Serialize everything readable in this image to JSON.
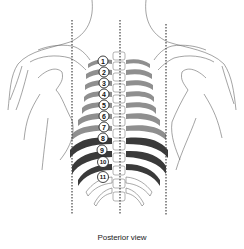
{
  "figure": {
    "caption": "Posterior view",
    "view": "posterior",
    "reference_lines": [
      "left scapular line",
      "vertebral midline",
      "right scapular line"
    ],
    "rib_labels": [
      "1",
      "2",
      "3",
      "4",
      "5",
      "6",
      "7",
      "8",
      "9",
      "10",
      "11"
    ],
    "colors": {
      "outline": "#555555",
      "rib_light": "#8f8f8f",
      "rib_dark": "#3a3a3a",
      "dotted_line": "#444444",
      "label_fill": "#ffffff"
    }
  }
}
